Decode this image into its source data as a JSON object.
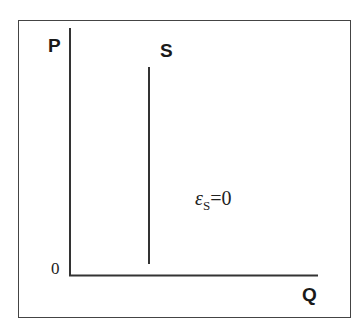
{
  "diagram": {
    "title": "",
    "axes": {
      "y_label": "P",
      "x_label": "Q",
      "origin_label": "0"
    },
    "curves": [
      {
        "name": "S",
        "label": "S",
        "type": "vertical-line",
        "description": "Perfectly inelastic supply"
      }
    ],
    "annotation": {
      "symbol": "ε",
      "subscript": "S",
      "equation_rest": "=0"
    },
    "colors": {
      "line": "#333333",
      "frame": "#444444",
      "background": "#ffffff"
    }
  }
}
